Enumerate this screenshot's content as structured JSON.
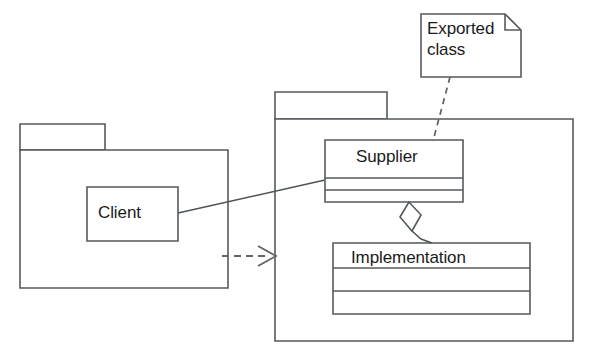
{
  "diagram": {
    "kind": "uml-package-diagram",
    "title_fragment": "",
    "background_color": "#ffffff",
    "line_color": "#555a5e",
    "text_color": "#1b1b1b"
  },
  "packages": [
    {
      "id": "client-package",
      "name": "",
      "tab": {
        "x": 20,
        "y": 124,
        "width": 85,
        "height": 26
      },
      "body": {
        "x": 20,
        "y": 150,
        "width": 208,
        "height": 138
      }
    },
    {
      "id": "supplier-package",
      "name": "",
      "tab": {
        "x": 275,
        "y": 92,
        "width": 112,
        "height": 27
      },
      "body": {
        "x": 275,
        "y": 119,
        "width": 298,
        "height": 222
      }
    }
  ],
  "classes": [
    {
      "id": "client-class",
      "label": "Client",
      "box": {
        "x": 87,
        "y": 187,
        "width": 91,
        "height": 54
      },
      "compartments": 1,
      "label_x": 98,
      "label_y": 203
    },
    {
      "id": "supplier-class",
      "label": "Supplier",
      "box": {
        "x": 325,
        "y": 140,
        "width": 138,
        "height": 62
      },
      "compartments": 3,
      "dividers": [
        38,
        50
      ],
      "label_x": 356,
      "label_y": 147
    },
    {
      "id": "implementation-class",
      "label": "Implementation",
      "box": {
        "x": 333,
        "y": 243,
        "width": 197,
        "height": 71
      },
      "compartments": 3,
      "dividers": [
        25,
        48
      ],
      "label_x": 351,
      "label_y": 248
    }
  ],
  "notes": [
    {
      "id": "exported-class-note",
      "text": "Exported\nclass",
      "box": {
        "x": 421,
        "y": 14,
        "width": 100,
        "height": 63
      },
      "fold": 16,
      "label_x": 427,
      "label_y": 18
    }
  ],
  "connectors": [
    {
      "id": "client-supplier-association",
      "type": "association",
      "style": "solid",
      "from": "client-class",
      "to": "supplier-class",
      "points": "178,213 325,180"
    },
    {
      "id": "package-dependency",
      "type": "dependency",
      "style": "dashed",
      "arrowhead": "open",
      "from": "client-package",
      "to": "supplier-package",
      "points": "228,256 275,256"
    },
    {
      "id": "note-anchor",
      "type": "note-anchor",
      "style": "dashed",
      "from": "exported-class-note",
      "to": "supplier-class",
      "points": "450,77 433,141"
    },
    {
      "id": "supplier-implementation-aggregation",
      "type": "aggregation",
      "style": "solid",
      "diamond": "hollow",
      "from": "supplier-class",
      "to": "implementation-class",
      "points": "409,202 403,218 412,231 421,215 409,202",
      "tail": "418,226 432,243"
    }
  ],
  "icons": {
    "folder_tab": "package-tab",
    "note_fold": "note-fold-corner",
    "open_arrow": "open-arrowhead",
    "hollow_diamond": "aggregation-diamond"
  }
}
